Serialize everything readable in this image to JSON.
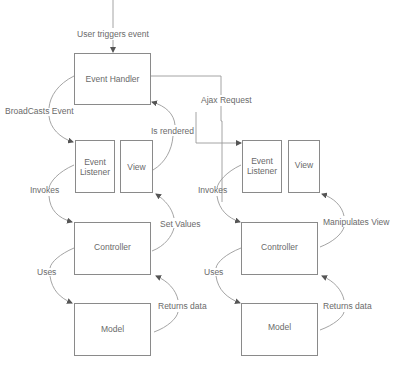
{
  "diagram": {
    "trigger_label": "User triggers event",
    "ajax_label": "Ajax Request",
    "left": {
      "event_handler": "Event Handler",
      "event_listener_line1": "Event",
      "event_listener_line2": "Listener",
      "view": "View",
      "controller": "Controller",
      "model": "Model",
      "edges": {
        "broadcasts": "BroadCasts Event",
        "rendered": "Is rendered",
        "invokes": "Invokes",
        "set_values": "Set Values",
        "uses": "Uses",
        "returns": "Returns data"
      }
    },
    "right": {
      "event_listener_line1": "Event",
      "event_listener_line2": "Listener",
      "view": "View",
      "controller": "Controller",
      "model": "Model",
      "edges": {
        "invokes": "Invokes",
        "manipulates": "Manipulates View",
        "uses": "Uses",
        "returns": "Returns data"
      }
    },
    "colors": {
      "box_stroke": "#8a8a8a",
      "line": "#9a9a9a",
      "text": "#6a6a6a"
    }
  }
}
